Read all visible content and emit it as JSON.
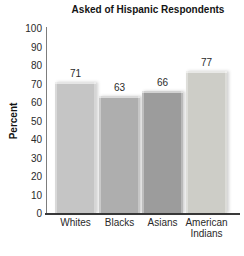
{
  "chart_data": {
    "type": "bar",
    "title": "Asked of Hispanic Respondents",
    "ylabel": "Percent",
    "xlabel": "",
    "categories": [
      "Whites",
      "Blacks",
      "Asians",
      "American Indians"
    ],
    "values": [
      71,
      63,
      66,
      77
    ],
    "bar_colors": [
      "#c5c5c5",
      "#aeaeae",
      "#9c9c9c",
      "#cdcdc7"
    ],
    "ylim": [
      0,
      100
    ],
    "yticks": [
      100,
      90,
      80,
      70,
      60,
      50,
      40,
      30,
      20,
      10,
      0
    ],
    "grid": false,
    "legend_position": "none",
    "axis_color": "#3a3a3a",
    "text_color": "#1f1f1f",
    "background_color": "#ffffff"
  }
}
